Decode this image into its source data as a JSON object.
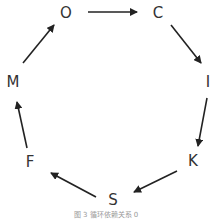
{
  "diagram": {
    "nodes": [
      {
        "id": "O",
        "label": "O",
        "x": 66,
        "y": 13
      },
      {
        "id": "C",
        "label": "C",
        "x": 158,
        "y": 13
      },
      {
        "id": "I",
        "label": "I",
        "x": 208,
        "y": 82
      },
      {
        "id": "K",
        "label": "K",
        "x": 193,
        "y": 161
      },
      {
        "id": "S",
        "label": "S",
        "x": 113,
        "y": 200
      },
      {
        "id": "F",
        "label": "F",
        "x": 30,
        "y": 162
      },
      {
        "id": "M",
        "label": "M",
        "x": 13,
        "y": 82
      }
    ],
    "edges": [
      {
        "from": "O",
        "to": "C"
      },
      {
        "from": "C",
        "to": "I"
      },
      {
        "from": "I",
        "to": "K"
      },
      {
        "from": "K",
        "to": "S"
      },
      {
        "from": "S",
        "to": "F"
      },
      {
        "from": "F",
        "to": "M"
      },
      {
        "from": "M",
        "to": "O"
      }
    ],
    "caption": "图 3  循环依赖关系 0"
  }
}
